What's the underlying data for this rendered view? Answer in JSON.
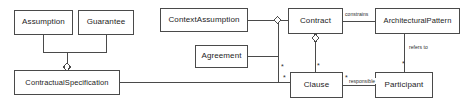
{
  "diagram": {
    "type": "uml-class-diagram",
    "background_color": "#ffffff",
    "stroke_color": "#4a4a4a",
    "text_color": "#1c1c1c",
    "classes": [
      {
        "id": "assumption",
        "label": "Assumption",
        "x": 14,
        "y": 10,
        "w": 59,
        "h": 25
      },
      {
        "id": "guarantee",
        "label": "Guarantee",
        "x": 78,
        "y": 10,
        "w": 56,
        "h": 25
      },
      {
        "id": "context_assumption",
        "label": "ContextAssumption",
        "x": 160,
        "y": 8,
        "w": 88,
        "h": 24
      },
      {
        "id": "contract",
        "label": "Contract",
        "x": 288,
        "y": 8,
        "w": 55,
        "h": 26
      },
      {
        "id": "architectural_pattern",
        "label": "ArchitecturalPattern",
        "x": 375,
        "y": 8,
        "w": 85,
        "h": 26
      },
      {
        "id": "agreement",
        "label": "Agreement",
        "x": 195,
        "y": 45,
        "w": 53,
        "h": 23
      },
      {
        "id": "contractual_specification",
        "label": "ContractualSpecification",
        "x": 14,
        "y": 70,
        "w": 106,
        "h": 25
      },
      {
        "id": "clause",
        "label": "Clause",
        "x": 290,
        "y": 72,
        "w": 53,
        "h": 26
      },
      {
        "id": "participant",
        "label": "Participant",
        "x": 375,
        "y": 72,
        "w": 58,
        "h": 26
      }
    ],
    "edge_labels": [
      {
        "id": "constrains-label",
        "text": "constrains",
        "x": 344,
        "y": 11
      },
      {
        "id": "refers-to-label",
        "text": "refers to",
        "x": 418,
        "y": 47
      },
      {
        "id": "responsible-label",
        "text": "responsible",
        "x": 350,
        "y": 78
      }
    ],
    "multiplicities": [
      {
        "id": "clause-top-star",
        "text": "*",
        "x": 313,
        "y": 62
      },
      {
        "id": "clause-left-star",
        "text": "*",
        "x": 282,
        "y": 74
      },
      {
        "id": "clause-right-star",
        "text": "*",
        "x": 345,
        "y": 74
      },
      {
        "id": "participant-top-star",
        "text": "*",
        "x": 400,
        "y": 60
      },
      {
        "id": "agreement-bus-star",
        "text": "*",
        "x": 282,
        "y": 63
      }
    ]
  }
}
